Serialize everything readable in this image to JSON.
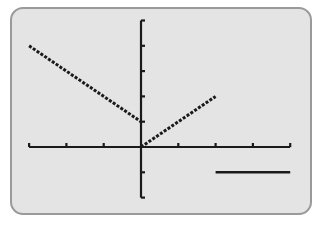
{
  "chart_data": {
    "type": "line",
    "title": "",
    "xlabel": "",
    "ylabel": "",
    "xlim": [
      -3,
      4
    ],
    "ylim": [
      -2,
      5
    ],
    "grid": false,
    "x_ticks": [
      -3,
      -2,
      -1,
      0,
      1,
      2,
      3,
      4
    ],
    "y_ticks": [
      -2,
      -1,
      0,
      1,
      2,
      3,
      4,
      5
    ],
    "tick_labels_shown": false,
    "series": [
      {
        "name": "piece-1",
        "style": "dotted",
        "x": [
          -3,
          0
        ],
        "y": [
          4,
          1
        ]
      },
      {
        "name": "piece-2",
        "style": "dotted",
        "x": [
          0,
          2
        ],
        "y": [
          0,
          2
        ]
      },
      {
        "name": "piece-3",
        "style": "solid",
        "x": [
          2,
          4
        ],
        "y": [
          -1,
          -1
        ]
      }
    ]
  },
  "screen": {
    "background": "#e4e4e4",
    "border": "#9a9a9a",
    "ink": "#1a1a1a"
  }
}
